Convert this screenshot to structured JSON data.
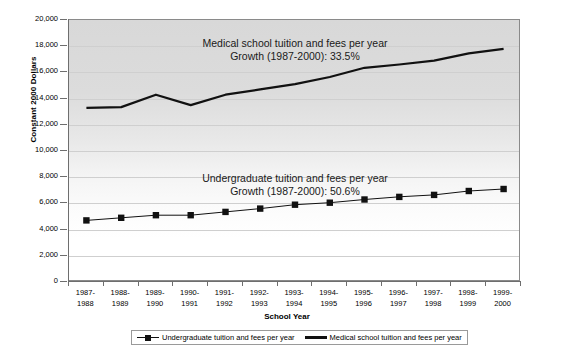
{
  "chart_data": {
    "type": "line",
    "title": "",
    "xlabel": "School Year",
    "ylabel": "Constant 2000 Dollars",
    "ylim": [
      0,
      20000
    ],
    "ytick_step": 2000,
    "grid": true,
    "legend_position": "bottom",
    "categories": [
      "1987-\n1988",
      "1988-\n1989",
      "1989-\n1990",
      "1990-\n1991",
      "1991-\n1992",
      "1992-\n1993",
      "1993-\n1994",
      "1994-\n1995",
      "1995-\n1996",
      "1996-\n1997",
      "1997-\n1998",
      "1998-\n1999",
      "1999-\n2000"
    ],
    "category_lines": [
      [
        "1987-",
        "1988"
      ],
      [
        "1988-",
        "1989"
      ],
      [
        "1989-",
        "1990"
      ],
      [
        "1990-",
        "1991"
      ],
      [
        "1991-",
        "1992"
      ],
      [
        "1992-",
        "1993"
      ],
      [
        "1993-",
        "1994"
      ],
      [
        "1994-",
        "1995"
      ],
      [
        "1995-",
        "1996"
      ],
      [
        "1996-",
        "1997"
      ],
      [
        "1997-",
        "1998"
      ],
      [
        "1998-",
        "1999"
      ],
      [
        "1999-",
        "2000"
      ]
    ],
    "ytick_labels": [
      "20,000",
      "18,000",
      "16,000",
      "14,000",
      "12,000",
      "10,000",
      "8,000",
      "6,000",
      "4,000",
      "2,000",
      "0"
    ],
    "ytick_values": [
      20000,
      18000,
      16000,
      14000,
      12000,
      10000,
      8000,
      6000,
      4000,
      2000,
      0
    ],
    "series": [
      {
        "name": "Undergraduate tuition and fees per year",
        "marker": "square",
        "color": "#111111",
        "values": [
          4700,
          4900,
          5100,
          5100,
          5350,
          5600,
          5900,
          6050,
          6300,
          6500,
          6650,
          6950,
          7100
        ]
      },
      {
        "name": "Medical school tuition and fees per year",
        "marker": "none",
        "color": "#111111",
        "values": [
          13300,
          13350,
          14300,
          13500,
          14300,
          14700,
          15100,
          15650,
          16350,
          16600,
          16900,
          17450,
          17800
        ]
      }
    ],
    "annotations": [
      {
        "id": "medical-annotation",
        "line1": "Medical school tuition and fees per year",
        "line2": "Growth (1987-2000): 33.5%"
      },
      {
        "id": "undergraduate-annotation",
        "line1": "Undergraduate tuition and fees per year",
        "line2": "Growth (1987-2000): 50.6%"
      }
    ]
  },
  "legend": {
    "items": [
      {
        "label": "Undergraduate tuition and fees per year"
      },
      {
        "label": "Medical school tuition and fees per year"
      }
    ]
  },
  "colors": {
    "line": "#111111",
    "plot_background_top": "#d8d8d8",
    "plot_background_bottom": "#ffffff",
    "gridline": "#cfcfcf",
    "axis": "#6e6e6e"
  }
}
